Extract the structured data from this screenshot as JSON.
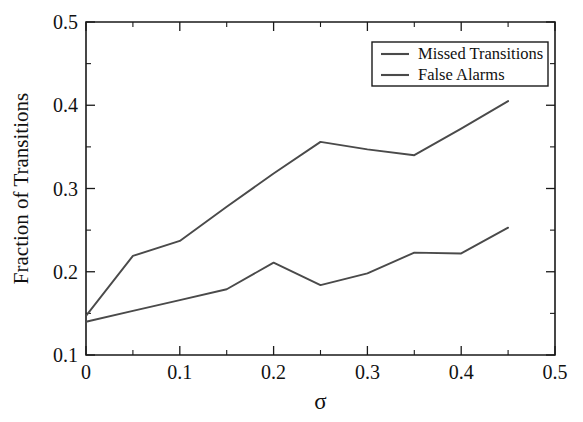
{
  "chart_data": {
    "type": "line",
    "title": "",
    "xlabel": "σ",
    "ylabel": "Fraction of Transitions",
    "xlim": [
      0,
      0.5
    ],
    "ylim": [
      0.1,
      0.5
    ],
    "grid": false,
    "legend_position": "top-right",
    "x": [
      0,
      0.05,
      0.1,
      0.15,
      0.2,
      0.25,
      0.3,
      0.35,
      0.4,
      0.45
    ],
    "series": [
      {
        "name": "Missed Transitions",
        "color": "#4a4a4a",
        "values": [
          0.147,
          0.219,
          0.237,
          0.278,
          0.318,
          0.356,
          0.347,
          0.34,
          0.372,
          0.405
        ]
      },
      {
        "name": "False Alarms",
        "color": "#4a4a4a",
        "values": [
          0.14,
          0.153,
          0.166,
          0.179,
          0.211,
          0.184,
          0.198,
          0.223,
          0.222,
          0.253
        ]
      }
    ],
    "x_ticks_major": [
      {
        "value": 0,
        "label": "0"
      },
      {
        "value": 0.1,
        "label": "0.1"
      },
      {
        "value": 0.2,
        "label": "0.2"
      },
      {
        "value": 0.3,
        "label": "0.3"
      },
      {
        "value": 0.4,
        "label": "0.4"
      },
      {
        "value": 0.5,
        "label": "0.5"
      }
    ],
    "x_ticks_minor": [
      0.05,
      0.15,
      0.25,
      0.35,
      0.45
    ],
    "y_ticks_major": [
      {
        "value": 0.1,
        "label": "0.1"
      },
      {
        "value": 0.2,
        "label": "0.2"
      },
      {
        "value": 0.3,
        "label": "0.3"
      },
      {
        "value": 0.4,
        "label": "0.4"
      },
      {
        "value": 0.5,
        "label": "0.5"
      }
    ],
    "y_ticks_minor": [
      0.15,
      0.25,
      0.35,
      0.45
    ]
  },
  "legend": {
    "entries": [
      {
        "label": "Missed Transitions"
      },
      {
        "label": "False Alarms"
      }
    ]
  },
  "colors": {
    "axis": "#1a1a1a",
    "line": "#4a4a4a",
    "background": "#ffffff",
    "text": "#111111"
  }
}
